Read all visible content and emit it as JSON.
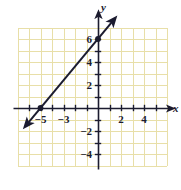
{
  "chart_data": {
    "type": "line",
    "title": "",
    "xlabel": "x",
    "ylabel": "y",
    "xlim": [
      -7,
      6
    ],
    "ylim": [
      -5,
      7
    ],
    "grid": true,
    "legend": false,
    "grid_color": "#e8dfa8",
    "axis_color": "#1b1b2f",
    "line_color": "#1b1b2f",
    "background_color": "#ffffff",
    "x_ticks": [
      -6,
      -5,
      -4,
      -3,
      -2,
      -1,
      1,
      2,
      3,
      4,
      5
    ],
    "x_tick_labels": [
      {
        "value": -5,
        "text": "−5"
      },
      {
        "value": -3,
        "text": "−3"
      },
      {
        "value": 2,
        "text": "2"
      },
      {
        "value": 4,
        "text": "4"
      }
    ],
    "y_ticks": [
      -4,
      -3,
      -2,
      -1,
      1,
      2,
      3,
      4,
      5,
      6
    ],
    "y_tick_labels": [
      {
        "value": 6,
        "text": "6"
      },
      {
        "value": 4,
        "text": "4"
      },
      {
        "value": 2,
        "text": "2"
      },
      {
        "value": -2,
        "text": "−2"
      },
      {
        "value": -4,
        "text": "−4"
      }
    ],
    "series": [
      {
        "name": "line",
        "equation": "y = 1.2x + 6",
        "slope": 1.2,
        "intercept": 6,
        "points": [
          {
            "x": -5,
            "y": 0,
            "marked": true
          },
          {
            "x": 0,
            "y": 6,
            "marked": true
          }
        ],
        "segment_from": {
          "x": -6.2,
          "y": -1.45
        },
        "segment_to": {
          "x": 1.35,
          "y": 7.65
        },
        "arrows": "both"
      }
    ]
  },
  "axis_labels": {
    "x": "x",
    "y": "y"
  }
}
